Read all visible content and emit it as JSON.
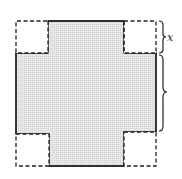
{
  "diagram": {
    "colors": {
      "background": "#ffffff",
      "shaded_region": "#e4e4e4",
      "outline": "#222222"
    },
    "labels": {
      "corner_side": "x",
      "middle_side": ""
    },
    "geometry": {
      "outer": {
        "x": 16,
        "y": 21,
        "w": 140,
        "h": 145
      },
      "corner_size": 32,
      "brace_x": 160
    }
  }
}
